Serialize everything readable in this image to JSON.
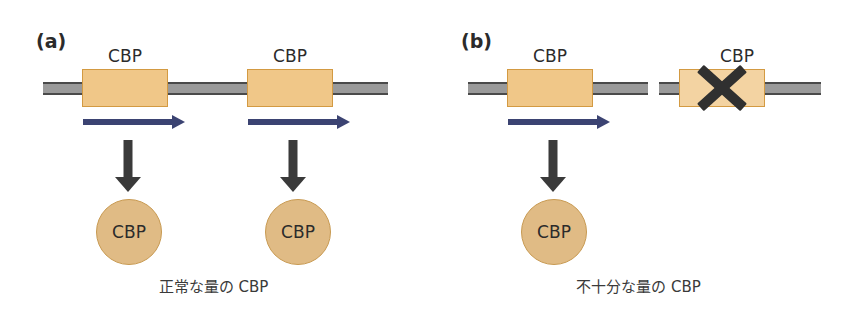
{
  "figure": {
    "background_color": "#ffffff",
    "width": 843,
    "height": 314
  },
  "colors": {
    "gene_box_fill": "#f0c788",
    "gene_box_fill_pale": "#f3d3a2",
    "gene_box_border": "#d39a42",
    "dna_strand_gray": "#9a9a9a",
    "dna_strand_edge": "#4a4a4a",
    "transcription_arrow": "#3b4372",
    "down_arrow": "#3a3a3a",
    "protein_fill": "#e0bb85",
    "protein_border": "#c89a52",
    "x_mark": "#303030",
    "text": "#2b2b2b"
  },
  "panels": [
    {
      "id": "panel-a",
      "letter": "(a)",
      "caption": "正常な量の CBP",
      "alleles": [
        {
          "id": "allele-a1",
          "gene_label": "CBP",
          "mutated": false,
          "transcribed": true
        },
        {
          "id": "allele-a2",
          "gene_label": "CBP",
          "mutated": false,
          "transcribed": true
        }
      ],
      "proteins": [
        {
          "id": "protein-a1",
          "label": "CBP"
        },
        {
          "id": "protein-a2",
          "label": "CBP"
        }
      ]
    },
    {
      "id": "panel-b",
      "letter": "(b)",
      "caption": "不十分な量の CBP",
      "alleles": [
        {
          "id": "allele-b1",
          "gene_label": "CBP",
          "mutated": false,
          "transcribed": true
        },
        {
          "id": "allele-b2",
          "gene_label": "CBP",
          "mutated": true,
          "transcribed": false
        }
      ],
      "proteins": [
        {
          "id": "protein-b1",
          "label": "CBP"
        }
      ]
    }
  ]
}
